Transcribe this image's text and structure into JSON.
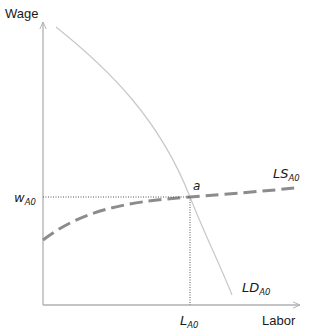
{
  "diagram": {
    "type": "labor-market",
    "y_axis_label": "Wage",
    "x_axis_label": "Labor",
    "equilibrium_point_label": "a",
    "wage_label": {
      "base": "w",
      "sub": "A0"
    },
    "labor_label": {
      "base": "L",
      "sub": "A0"
    },
    "demand_label": {
      "base": "LD",
      "sub": "A0"
    },
    "supply_label": {
      "base": "LS",
      "sub": "A0"
    },
    "colors": {
      "axis": "#b0b0b0",
      "demand_curve": "#c8c8c8",
      "supply_curve": "#8c8c8c",
      "guide_lines": "#555555",
      "text": "#1a1a1a"
    }
  }
}
